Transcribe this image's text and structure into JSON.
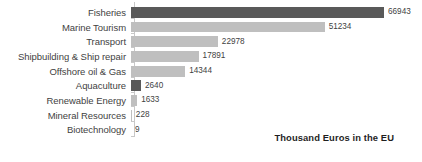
{
  "chart_data": {
    "type": "bar",
    "orientation": "horizontal",
    "title": "",
    "subtitle": "",
    "xlabel": "",
    "ylabel": "",
    "categories": [
      "Fisheries",
      "Marine Tourism",
      "Transport",
      "Shipbuilding & Ship repair",
      "Offshore oil & Gas",
      "Aquaculture",
      "Renewable Energy",
      "Mineral Resources",
      "Biotechnology"
    ],
    "values": [
      66943,
      51234,
      22978,
      17891,
      14344,
      2640,
      1633,
      228,
      9
    ],
    "value_labels": [
      "66943",
      "51234",
      "22978",
      "17891",
      "14344",
      "2640",
      "1633",
      "228",
      "9"
    ],
    "bar_colors": [
      "#595959",
      "#bfbfbf",
      "#bfbfbf",
      "#bfbfbf",
      "#bfbfbf",
      "#595959",
      "#bfbfbf",
      "#bfbfbf",
      "#bfbfbf"
    ],
    "xlim": [
      0,
      66943
    ],
    "grid": false,
    "legend": null,
    "annotations": [
      {
        "text": "Thousand Euros in the EU",
        "position": "bottom-right",
        "bold": true
      }
    ],
    "axis_line_color": "#c8c8c8",
    "background": "#ffffff"
  },
  "annotation": {
    "text": "Thousand Euros in the EU"
  }
}
